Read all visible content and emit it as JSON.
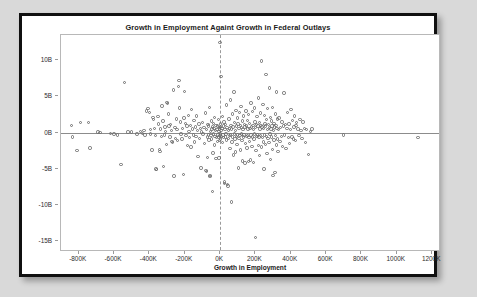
{
  "chart_data": {
    "type": "scatter",
    "title": "Growth in Employment Againt Growth in Federal Outlays",
    "xlabel": "Growth in Employment",
    "ylabel": "Growth in Federal Outlays",
    "xlim": [
      -900000,
      1250000
    ],
    "ylim": [
      -16.5,
      13.5
    ],
    "xticks": [
      -800000,
      -600000,
      -400000,
      -200000,
      0,
      200000,
      400000,
      600000,
      800000,
      1000000,
      1200000
    ],
    "xtick_labels": [
      "-800K",
      "-600K",
      "-400K",
      "-200K",
      "0K",
      "200K",
      "400K",
      "600K",
      "800K",
      "1000K",
      "1200K"
    ],
    "yticks": [
      10,
      5,
      0,
      -5,
      -10,
      -15
    ],
    "ytick_labels": [
      "10B",
      "5B",
      "0B",
      "-5B",
      "-10B",
      "-15B"
    ],
    "grid": false,
    "legend": false,
    "marker": "open-circle",
    "marker_color": "#6e6e6e",
    "reference_lines": [
      {
        "orientation": "horizontal",
        "value": 0,
        "style": "solid",
        "color": "#8c8c8c"
      },
      {
        "orientation": "vertical",
        "value": 0,
        "style": "dashed",
        "color": "#9a9a9a"
      }
    ],
    "points": [
      [
        -840000,
        1.0
      ],
      [
        -835000,
        -0.6
      ],
      [
        -810000,
        -2.5
      ],
      [
        -790000,
        1.4
      ],
      [
        -745000,
        1.4
      ],
      [
        -735000,
        -2.1
      ],
      [
        -690000,
        0.1
      ],
      [
        -680000,
        0.0
      ],
      [
        -620000,
        -0.1
      ],
      [
        -600000,
        -0.2
      ],
      [
        -580000,
        -0.3
      ],
      [
        -560000,
        -4.4
      ],
      [
        -540000,
        6.9
      ],
      [
        -520000,
        0.1
      ],
      [
        -500000,
        0.1
      ],
      [
        -470000,
        -0.2
      ],
      [
        -450000,
        0.2
      ],
      [
        -440000,
        -0.1
      ],
      [
        -430000,
        0.3
      ],
      [
        -425000,
        -0.3
      ],
      [
        -415000,
        3.0
      ],
      [
        -408000,
        3.3
      ],
      [
        -400000,
        2.8
      ],
      [
        -395000,
        0.4
      ],
      [
        -392000,
        -0.2
      ],
      [
        -385000,
        -2.4
      ],
      [
        -380000,
        2.1
      ],
      [
        -375000,
        1.8
      ],
      [
        -370000,
        0.6
      ],
      [
        -366000,
        -0.4
      ],
      [
        -362000,
        -5.0
      ],
      [
        -358000,
        -5.1
      ],
      [
        -352000,
        2.2
      ],
      [
        -348000,
        1.2
      ],
      [
        -344000,
        -2.3
      ],
      [
        -340000,
        -2.6
      ],
      [
        -336000,
        0.5
      ],
      [
        -332000,
        -0.5
      ],
      [
        -328000,
        3.7
      ],
      [
        -324000,
        1.6
      ],
      [
        -320000,
        -4.7
      ],
      [
        -316000,
        -0.3
      ],
      [
        -312000,
        0.8
      ],
      [
        -308000,
        0.2
      ],
      [
        -304000,
        -1.6
      ],
      [
        -300000,
        4.2
      ],
      [
        -296000,
        4.0
      ],
      [
        -292000,
        2.6
      ],
      [
        -288000,
        0.9
      ],
      [
        -284000,
        -0.6
      ],
      [
        -280000,
        1.1
      ],
      [
        -276000,
        0.3
      ],
      [
        -272000,
        -1.2
      ],
      [
        -268000,
        -1.4
      ],
      [
        -264000,
        5.9
      ],
      [
        -260000,
        -6.0
      ],
      [
        -256000,
        0.7
      ],
      [
        -252000,
        -0.8
      ],
      [
        -248000,
        1.9
      ],
      [
        -244000,
        0.4
      ],
      [
        -240000,
        -1.1
      ],
      [
        -236000,
        6.4
      ],
      [
        -232000,
        7.2
      ],
      [
        -228000,
        3.4
      ],
      [
        -224000,
        1.5
      ],
      [
        -220000,
        -0.2
      ],
      [
        -216000,
        -0.9
      ],
      [
        -212000,
        0.6
      ],
      [
        -208000,
        -5.8
      ],
      [
        -204000,
        2.0
      ],
      [
        -200000,
        5.7
      ],
      [
        -196000,
        1.3
      ],
      [
        -192000,
        -0.4
      ],
      [
        -188000,
        0.9
      ],
      [
        -184000,
        -1.8
      ],
      [
        -180000,
        2.4
      ],
      [
        -176000,
        0.2
      ],
      [
        -172000,
        -0.7
      ],
      [
        -168000,
        1.0
      ],
      [
        -164000,
        -2.0
      ],
      [
        -160000,
        3.2
      ],
      [
        -156000,
        0.5
      ],
      [
        -152000,
        -0.3
      ],
      [
        -148000,
        1.7
      ],
      [
        -144000,
        -1.3
      ],
      [
        -140000,
        0.8
      ],
      [
        -136000,
        -0.5
      ],
      [
        -132000,
        2.3
      ],
      [
        -128000,
        0.3
      ],
      [
        -124000,
        -3.3
      ],
      [
        -120000,
        1.2
      ],
      [
        -116000,
        -0.8
      ],
      [
        -112000,
        0.6
      ],
      [
        -108000,
        -4.9
      ],
      [
        -104000,
        0.1
      ],
      [
        -100000,
        1.4
      ],
      [
        -96000,
        -0.2
      ],
      [
        -92000,
        0.7
      ],
      [
        -88000,
        -1.5
      ],
      [
        -84000,
        2.7
      ],
      [
        -80000,
        -5.2
      ],
      [
        -78000,
        -5.4
      ],
      [
        -76000,
        0.4
      ],
      [
        -72000,
        -0.6
      ],
      [
        -70000,
        -3.4
      ],
      [
        -68000,
        1.1
      ],
      [
        -66000,
        -0.3
      ],
      [
        -64000,
        0.9
      ],
      [
        -62000,
        -1.0
      ],
      [
        -60000,
        3.5
      ],
      [
        -58000,
        -5.9
      ],
      [
        -56000,
        -6.1
      ],
      [
        -54000,
        0.2
      ],
      [
        -52000,
        -0.4
      ],
      [
        -50000,
        1.6
      ],
      [
        -48000,
        -0.9
      ],
      [
        -46000,
        0.5
      ],
      [
        -44000,
        -8.1
      ],
      [
        -42000,
        0.8
      ],
      [
        -40000,
        -2.8
      ],
      [
        -38000,
        1.3
      ],
      [
        -36000,
        -0.2
      ],
      [
        -34000,
        0.6
      ],
      [
        -32000,
        -1.7
      ],
      [
        -30000,
        2.1
      ],
      [
        -28000,
        -0.5
      ],
      [
        -26000,
        0.3
      ],
      [
        -24000,
        -3.6
      ],
      [
        -22000,
        1.0
      ],
      [
        -20000,
        -0.7
      ],
      [
        -18000,
        0.4
      ],
      [
        -16000,
        -1.2
      ],
      [
        -14000,
        0.9
      ],
      [
        -12000,
        -0.3
      ],
      [
        -10000,
        1.8
      ],
      [
        -8000,
        -0.6
      ],
      [
        -6000,
        0.2
      ],
      [
        -5000,
        -3.5
      ],
      [
        -4000,
        0.7
      ],
      [
        -3000,
        -1.1
      ],
      [
        -2000,
        0.5
      ],
      [
        -1000,
        -0.4
      ],
      [
        0,
        12.5
      ],
      [
        1000,
        0.8
      ],
      [
        2000,
        -0.2
      ],
      [
        3000,
        1.2
      ],
      [
        4000,
        -0.9
      ],
      [
        5000,
        0.3
      ],
      [
        6000,
        7.8
      ],
      [
        8000,
        -0.5
      ],
      [
        10000,
        0.6
      ],
      [
        12000,
        -1.4
      ],
      [
        14000,
        2.2
      ],
      [
        16000,
        -0.3
      ],
      [
        18000,
        0.9
      ],
      [
        20000,
        -0.7
      ],
      [
        22000,
        1.5
      ],
      [
        24000,
        -6.8
      ],
      [
        26000,
        -7.0
      ],
      [
        28000,
        0.4
      ],
      [
        30000,
        -0.6
      ],
      [
        32000,
        1.1
      ],
      [
        34000,
        -0.2
      ],
      [
        36000,
        3.8
      ],
      [
        38000,
        -1.0
      ],
      [
        40000,
        0.7
      ],
      [
        42000,
        -7.2
      ],
      [
        44000,
        -7.4
      ],
      [
        46000,
        0.3
      ],
      [
        48000,
        -0.8
      ],
      [
        50000,
        1.9
      ],
      [
        52000,
        -0.4
      ],
      [
        54000,
        0.6
      ],
      [
        56000,
        -2.2
      ],
      [
        58000,
        4.5
      ],
      [
        60000,
        -0.3
      ],
      [
        62000,
        1.0
      ],
      [
        64000,
        -9.6
      ],
      [
        66000,
        0.5
      ],
      [
        68000,
        -1.3
      ],
      [
        70000,
        2.6
      ],
      [
        72000,
        -0.6
      ],
      [
        74000,
        0.8
      ],
      [
        76000,
        -3.1
      ],
      [
        78000,
        5.6
      ],
      [
        80000,
        -0.2
      ],
      [
        82000,
        1.4
      ],
      [
        84000,
        -0.9
      ],
      [
        86000,
        0.3
      ],
      [
        88000,
        -2.7
      ],
      [
        90000,
        3.1
      ],
      [
        92000,
        -0.5
      ],
      [
        94000,
        0.9
      ],
      [
        96000,
        -1.6
      ],
      [
        98000,
        2.0
      ],
      [
        100000,
        -0.3
      ],
      [
        102000,
        1.2
      ],
      [
        104000,
        -4.9
      ],
      [
        106000,
        0.6
      ],
      [
        108000,
        -0.8
      ],
      [
        110000,
        2.8
      ],
      [
        112000,
        -0.4
      ],
      [
        114000,
        1.0
      ],
      [
        116000,
        -2.4
      ],
      [
        118000,
        3.6
      ],
      [
        120000,
        -0.2
      ],
      [
        122000,
        0.7
      ],
      [
        124000,
        -1.1
      ],
      [
        126000,
        1.6
      ],
      [
        128000,
        -3.9
      ],
      [
        130000,
        0.4
      ],
      [
        132000,
        -0.6
      ],
      [
        134000,
        2.3
      ],
      [
        136000,
        -0.3
      ],
      [
        138000,
        1.1
      ],
      [
        140000,
        -4.2
      ],
      [
        142000,
        0.8
      ],
      [
        144000,
        -1.5
      ],
      [
        146000,
        3.0
      ],
      [
        148000,
        -0.5
      ],
      [
        150000,
        0.9
      ],
      [
        152000,
        -2.1
      ],
      [
        154000,
        1.7
      ],
      [
        156000,
        -0.4
      ],
      [
        158000,
        0.5
      ],
      [
        160000,
        -4.0
      ],
      [
        162000,
        2.5
      ],
      [
        164000,
        -0.7
      ],
      [
        166000,
        1.3
      ],
      [
        168000,
        -1.2
      ],
      [
        170000,
        0.6
      ],
      [
        172000,
        -3.8
      ],
      [
        174000,
        4.1
      ],
      [
        176000,
        -0.3
      ],
      [
        178000,
        0.8
      ],
      [
        180000,
        -1.9
      ],
      [
        182000,
        2.9
      ],
      [
        184000,
        -0.6
      ],
      [
        186000,
        1.0
      ],
      [
        188000,
        -4.1
      ],
      [
        190000,
        0.4
      ],
      [
        192000,
        -0.9
      ],
      [
        194000,
        3.4
      ],
      [
        196000,
        -0.2
      ],
      [
        198000,
        1.5
      ],
      [
        200000,
        -14.5
      ],
      [
        202000,
        0.7
      ],
      [
        204000,
        -2.5
      ],
      [
        206000,
        1.1
      ],
      [
        208000,
        -0.5
      ],
      [
        210000,
        2.2
      ],
      [
        212000,
        -0.3
      ],
      [
        214000,
        0.9
      ],
      [
        216000,
        -1.8
      ],
      [
        218000,
        4.8
      ],
      [
        220000,
        -0.6
      ],
      [
        222000,
        1.4
      ],
      [
        224000,
        -3.2
      ],
      [
        226000,
        0.5
      ],
      [
        228000,
        2.7
      ],
      [
        230000,
        -0.4
      ],
      [
        232000,
        1.0
      ],
      [
        234000,
        -2.0
      ],
      [
        236000,
        9.9
      ],
      [
        238000,
        0.8
      ],
      [
        240000,
        -0.7
      ],
      [
        242000,
        3.9
      ],
      [
        244000,
        -1.3
      ],
      [
        246000,
        0.6
      ],
      [
        248000,
        -5.0
      ],
      [
        250000,
        2.4
      ],
      [
        252000,
        -0.3
      ],
      [
        254000,
        1.2
      ],
      [
        256000,
        -1.6
      ],
      [
        258000,
        0.9
      ],
      [
        260000,
        8.0
      ],
      [
        262000,
        -0.5
      ],
      [
        264000,
        1.8
      ],
      [
        266000,
        -2.9
      ],
      [
        268000,
        0.4
      ],
      [
        270000,
        3.3
      ],
      [
        272000,
        -0.8
      ],
      [
        274000,
        1.1
      ],
      [
        276000,
        -1.4
      ],
      [
        278000,
        0.7
      ],
      [
        280000,
        6.2
      ],
      [
        282000,
        -0.2
      ],
      [
        284000,
        2.1
      ],
      [
        286000,
        -3.7
      ],
      [
        288000,
        0.5
      ],
      [
        290000,
        1.6
      ],
      [
        292000,
        -0.6
      ],
      [
        294000,
        0.9
      ],
      [
        296000,
        -2.3
      ],
      [
        298000,
        3.5
      ],
      [
        300000,
        -5.9
      ],
      [
        302000,
        0.3
      ],
      [
        304000,
        1.3
      ],
      [
        306000,
        -1.0
      ],
      [
        308000,
        0.8
      ],
      [
        310000,
        -5.5
      ],
      [
        312000,
        2.6
      ],
      [
        314000,
        -0.4
      ],
      [
        316000,
        1.0
      ],
      [
        318000,
        -1.7
      ],
      [
        320000,
        5.6
      ],
      [
        322000,
        0.6
      ],
      [
        324000,
        -0.9
      ],
      [
        326000,
        1.9
      ],
      [
        328000,
        -2.6
      ],
      [
        330000,
        0.4
      ],
      [
        334000,
        2.0
      ],
      [
        338000,
        -1.2
      ],
      [
        342000,
        0.7
      ],
      [
        346000,
        -0.5
      ],
      [
        350000,
        1.5
      ],
      [
        354000,
        -1.9
      ],
      [
        358000,
        0.9
      ],
      [
        362000,
        5.5
      ],
      [
        366000,
        -0.3
      ],
      [
        370000,
        1.1
      ],
      [
        374000,
        -2.2
      ],
      [
        378000,
        0.6
      ],
      [
        382000,
        2.8
      ],
      [
        386000,
        -0.7
      ],
      [
        390000,
        1.2
      ],
      [
        394000,
        -1.5
      ],
      [
        398000,
        0.4
      ],
      [
        402000,
        3.2
      ],
      [
        406000,
        -0.6
      ],
      [
        410000,
        1.7
      ],
      [
        414000,
        -0.9
      ],
      [
        418000,
        0.8
      ],
      [
        422000,
        2.3
      ],
      [
        426000,
        -1.1
      ],
      [
        430000,
        1.0
      ],
      [
        434000,
        1.4
      ],
      [
        440000,
        0.5
      ],
      [
        446000,
        -0.4
      ],
      [
        452000,
        1.8
      ],
      [
        458000,
        0.3
      ],
      [
        464000,
        -0.8
      ],
      [
        470000,
        1.5
      ],
      [
        476000,
        0.6
      ],
      [
        482000,
        -1.4
      ],
      [
        490000,
        0.4
      ],
      [
        500000,
        -3.0
      ],
      [
        510000,
        0.2
      ],
      [
        520000,
        0.5
      ],
      [
        700000,
        -0.3
      ],
      [
        1120000,
        -0.7
      ]
    ]
  }
}
